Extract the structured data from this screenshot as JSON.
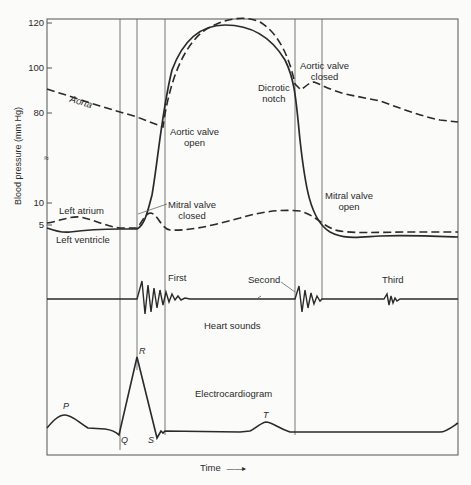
{
  "figure": {
    "y_axis_label": "Blood pressure (mm Hg)",
    "x_axis_label": "Time",
    "x_axis_arrow": "——▸",
    "axis_break_symbol": "≈",
    "y_ticks": [
      {
        "value": "120",
        "y": 22
      },
      {
        "value": "100",
        "y": 68
      },
      {
        "value": "80",
        "y": 113
      },
      {
        "value": "10",
        "y": 203
      },
      {
        "value": "5",
        "y": 226
      }
    ],
    "frame": {
      "left": 47,
      "top": 19,
      "right": 458,
      "bottom": 455
    },
    "event_lines_x": [
      120,
      137,
      165,
      295,
      322
    ],
    "colors": {
      "line": "#2a2a2a",
      "frame": "#555555",
      "background": "#fbfbf9"
    }
  },
  "labels": {
    "aorta": "Aorta",
    "left_atrium": "Left atrium",
    "left_ventricle": "Left ventricle",
    "aortic_valve_open": [
      "Aortic valve",
      "open"
    ],
    "dicrotic_notch": [
      "Dicrotic",
      "notch"
    ],
    "aortic_valve_closed": [
      "Aortic valve",
      "closed"
    ],
    "mitral_valve_closed": [
      "Mitral valve",
      "closed"
    ],
    "mitral_valve_open": [
      "Mitral valve",
      "open"
    ],
    "first": "First",
    "second": "Second",
    "third": "Third",
    "heart_sounds": "Heart sounds",
    "electrocardiogram": "Electrocardiogram",
    "ecg_p": "P",
    "ecg_q": "Q",
    "ecg_r": "R",
    "ecg_s": "S",
    "ecg_t": "T"
  },
  "traces": {
    "aorta_pressure": "dashed",
    "left_atrium_pressure": "dashed",
    "left_ventricle_pressure": "solid",
    "heart_sounds": "solid",
    "electrocardiogram": "solid"
  }
}
